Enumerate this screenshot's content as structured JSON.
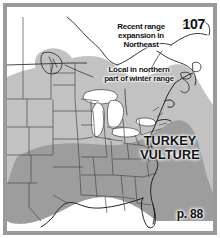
{
  "figure": {
    "kind": "range-map",
    "plate_number": "107",
    "species_name_line1": "TURKEY",
    "species_name_line2": "VULTURE",
    "page_reference": "p. 88",
    "frame_color": "#9a9a9a",
    "background_color": "#ffffff"
  },
  "annotations": [
    {
      "id": "northeast",
      "text": "Recent range\nexpansion in\nNortheast"
    },
    {
      "id": "winter",
      "text": "Local in northern\npart of winter range"
    }
  ],
  "map": {
    "region": "eastern and central North America",
    "land_fill": "#ffffff",
    "state_border_color": "#4a4a4a",
    "coastline_color": "#2b2b2b",
    "water_fill": "#ffffff",
    "ranges": [
      {
        "id": "summer-breeding-range",
        "label": "Summer / breeding range",
        "color": "#c2c2c2"
      },
      {
        "id": "winter-range",
        "label": "Winter range",
        "color": "#9d9d9d"
      },
      {
        "id": "isolated-northwest-population",
        "label": "Isolated northwest population",
        "color": "#c2c2c2"
      }
    ]
  }
}
